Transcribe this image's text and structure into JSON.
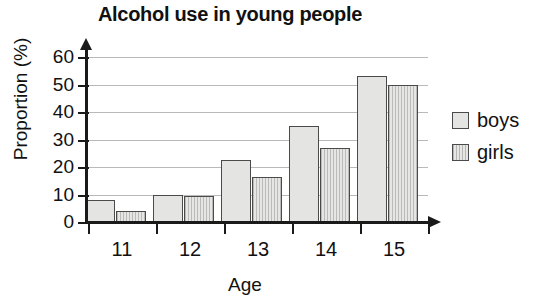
{
  "chart_data": {
    "type": "bar",
    "title": "Alcohol use in young people",
    "xlabel": "Age",
    "ylabel": "Proportion (%)",
    "categories": [
      "11",
      "12",
      "13",
      "14",
      "15"
    ],
    "series": [
      {
        "name": "boys",
        "values": [
          8,
          10,
          22.5,
          35,
          53
        ]
      },
      {
        "name": "girls",
        "values": [
          4,
          9.5,
          16.5,
          27,
          50
        ]
      }
    ],
    "ylim": [
      0,
      60
    ],
    "yticks": [
      0,
      10,
      20,
      30,
      40,
      50,
      60
    ],
    "ytick_labels": [
      "0",
      "10",
      "20",
      "30",
      "40",
      "50",
      "60"
    ],
    "grid": "horizontal",
    "legend_position": "right",
    "legend_entries": [
      "boys",
      "girls"
    ],
    "colors": {
      "boys_fill": "#e4e4e2",
      "girls_fill": "#e6e6e4",
      "bar_outline": "#4a4a4a",
      "axis": "#1a1a1a",
      "gridline": "#b9b9b9",
      "text": "#111111",
      "background": "#ffffff"
    }
  }
}
